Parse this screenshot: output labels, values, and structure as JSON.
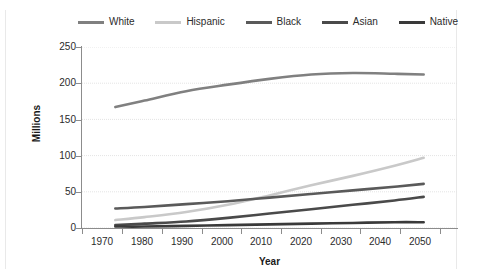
{
  "chart_data": {
    "type": "line",
    "title": "",
    "xlabel": "Year",
    "ylabel": "Millions",
    "xlim": [
      1965,
      2055
    ],
    "ylim": [
      0,
      250
    ],
    "grid": true,
    "grid_axis": "y",
    "legend_position": "top",
    "x": [
      1973,
      1980,
      1990,
      2000,
      2010,
      2020,
      2030,
      2040,
      2047
    ],
    "x_ticks": [
      "1970",
      "1980",
      "1990",
      "2000",
      "2010",
      "2020",
      "2030",
      "2040",
      "2050"
    ],
    "y_ticks": [
      "0",
      "50",
      "100",
      "150",
      "200",
      "250"
    ],
    "series": [
      {
        "name": "White",
        "color": "#808080",
        "values": [
          167,
          176,
          189,
          198,
          206,
          212,
          214,
          213,
          212
        ]
      },
      {
        "name": "Hispanic",
        "color": "#c9c9c9",
        "values": [
          11,
          15,
          22,
          32,
          45,
          59,
          72,
          86,
          97
        ]
      },
      {
        "name": "Black",
        "color": "#5a5a5a",
        "values": [
          27,
          29,
          33,
          37,
          42,
          47,
          52,
          57,
          61
        ]
      },
      {
        "name": "Asian",
        "color": "#4a4a4a",
        "values": [
          4,
          6,
          9,
          14,
          20,
          26,
          32,
          38,
          43
        ]
      },
      {
        "name": "Native",
        "color": "#3a3a3a",
        "values": [
          2,
          2,
          3,
          4,
          5,
          6,
          7,
          8,
          8
        ]
      }
    ]
  },
  "legend": {
    "items": [
      {
        "label": "White",
        "color": "#808080"
      },
      {
        "label": "Hispanic",
        "color": "#c9c9c9"
      },
      {
        "label": "Black",
        "color": "#5a5a5a"
      },
      {
        "label": "Asian",
        "color": "#4a4a4a"
      },
      {
        "label": "Native",
        "color": "#3a3a3a"
      }
    ]
  },
  "axes": {
    "x_title": "Year",
    "y_title": "Millions",
    "x_tick_labels": [
      "1970",
      "1980",
      "1990",
      "2000",
      "2010",
      "2020",
      "2030",
      "2040",
      "2050"
    ],
    "y_tick_labels": [
      "250",
      "200",
      "150",
      "100",
      "50",
      "0"
    ]
  },
  "colors": {
    "axis": "#8c8c8c",
    "grid": "#e4e4e4",
    "text": "#2b2b2b",
    "background": "#ffffff"
  }
}
